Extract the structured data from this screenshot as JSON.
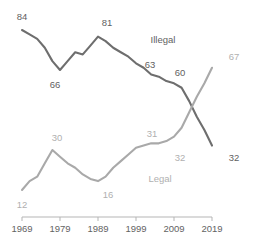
{
  "chart_data": {
    "type": "line",
    "title": "",
    "subtitle": "",
    "xlabel": "",
    "ylabel": "",
    "grid": false,
    "legend_position": "inline-labels",
    "xlim": [
      1969,
      2019
    ],
    "ylim": [
      0,
      90
    ],
    "xticks": [
      "1969",
      "1979",
      "1989",
      "1999",
      "2009",
      "2019"
    ],
    "xtick_values": [
      1969,
      1979,
      1989,
      1999,
      2009,
      2019
    ],
    "colors": {
      "illegal": "#6e6e6e",
      "legal": "#a9a9a9",
      "axis": "#b5b5b5",
      "label_dark": "#5f5f5f",
      "label_light": "#b0b0b0",
      "background": "#ffffff"
    },
    "series": [
      {
        "name": "Illegal",
        "color": "#6e6e6e",
        "x": [
          1969,
          1971,
          1973,
          1975,
          1977,
          1979,
          1981,
          1983,
          1985,
          1987,
          1989,
          1991,
          1993,
          1995,
          1997,
          1999,
          2001,
          2003,
          2005,
          2007,
          2009,
          2011,
          2013,
          2015,
          2017,
          2019
        ],
        "values": [
          84,
          82,
          80,
          76,
          70,
          66,
          70,
          74,
          73,
          77,
          81,
          79,
          76,
          74,
          72,
          69,
          67,
          64,
          63,
          61,
          60,
          58,
          52,
          45,
          39,
          32
        ]
      },
      {
        "name": "Legal",
        "color": "#a9a9a9",
        "x": [
          1969,
          1971,
          1973,
          1975,
          1977,
          1979,
          1981,
          1983,
          1985,
          1987,
          1989,
          1991,
          1993,
          1995,
          1997,
          1999,
          2001,
          2003,
          2005,
          2007,
          2009,
          2011,
          2013,
          2015,
          2017,
          2019
        ],
        "values": [
          12,
          16,
          18,
          24,
          30,
          27,
          24,
          22,
          19,
          17,
          16,
          18,
          22,
          25,
          28,
          31,
          32,
          33,
          33,
          34,
          36,
          40,
          47,
          54,
          60,
          67
        ]
      }
    ],
    "point_labels": [
      {
        "text": "84",
        "series": "Illegal",
        "year": 1969,
        "value": 84,
        "tone": "dark",
        "x": 22,
        "y": 20
      },
      {
        "text": "66",
        "series": "Illegal",
        "year": 1979,
        "value": 66,
        "tone": "dark",
        "x": 55,
        "y": 88
      },
      {
        "text": "81",
        "series": "Illegal",
        "year": 1989,
        "value": 81,
        "tone": "dark",
        "x": 107,
        "y": 26
      },
      {
        "text": "63",
        "series": "Illegal",
        "year": 2005,
        "value": 63,
        "tone": "dark",
        "x": 150,
        "y": 68
      },
      {
        "text": "60",
        "series": "Illegal",
        "year": 2009,
        "value": 60,
        "tone": "dark",
        "x": 180,
        "y": 76
      },
      {
        "text": "32",
        "series": "Illegal",
        "year": 2019,
        "value": 32,
        "tone": "dark",
        "x": 234,
        "y": 161
      },
      {
        "text": "12",
        "series": "Legal",
        "year": 1969,
        "value": 12,
        "tone": "light",
        "x": 22,
        "y": 208
      },
      {
        "text": "30",
        "series": "Legal",
        "year": 1977,
        "value": 30,
        "tone": "light",
        "x": 57,
        "y": 141
      },
      {
        "text": "16",
        "series": "Legal",
        "year": 1989,
        "value": 16,
        "tone": "light",
        "x": 108,
        "y": 198
      },
      {
        "text": "31",
        "series": "Legal",
        "year": 1999,
        "value": 31,
        "tone": "light",
        "x": 152,
        "y": 137
      },
      {
        "text": "32",
        "series": "Legal",
        "year": 2005,
        "value": 32,
        "tone": "light",
        "x": 180,
        "y": 161
      },
      {
        "text": "67",
        "series": "Legal",
        "year": 2019,
        "value": 67,
        "tone": "light",
        "x": 234,
        "y": 60
      }
    ],
    "inline_series_labels": [
      {
        "text": "Illegal",
        "tone": "dark",
        "x": 163,
        "y": 43
      },
      {
        "text": "Legal",
        "tone": "light",
        "x": 160,
        "y": 182
      }
    ]
  }
}
